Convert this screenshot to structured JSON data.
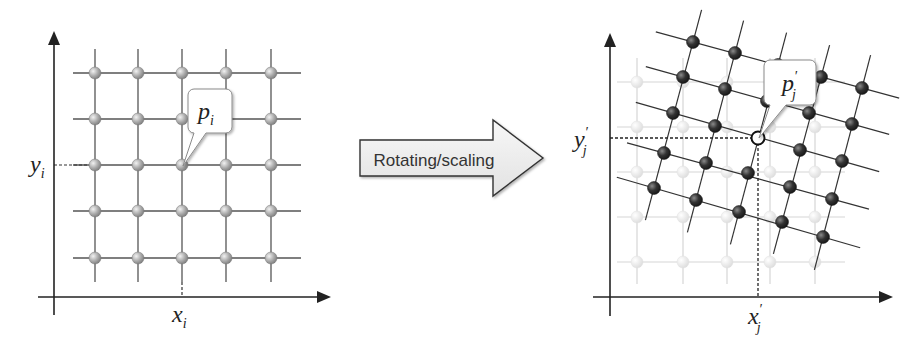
{
  "left_panel": {
    "name": "original-grid",
    "point_label": "p",
    "point_sub": "i",
    "x_label": "x",
    "x_sub": "i",
    "y_label": "y",
    "y_sub": "i",
    "grid_cols_x": [
      95,
      138,
      182,
      226,
      271
    ],
    "grid_rows_y": [
      73,
      119,
      165,
      211,
      258
    ],
    "highlight": {
      "col": 2,
      "row": 2
    }
  },
  "transform_arrow": {
    "label": "Rotating/scaling"
  },
  "right_panel": {
    "name": "transformed-grid",
    "point_label": "p",
    "point_prime": "′",
    "point_sub": "j",
    "x_label": "x",
    "x_prime": "′",
    "x_sub": "j",
    "y_label": "y",
    "y_prime": "′",
    "y_sub": "j",
    "ghost_cols_x": [
      637,
      683,
      727,
      770,
      815
    ],
    "ghost_rows_y": [
      82,
      127,
      172,
      217,
      262
    ],
    "transformed_points": [
      [
        [
          693,
          42
        ],
        [
          735,
          53
        ],
        [
          778,
          65
        ],
        [
          821,
          77
        ],
        [
          862,
          88
        ]
      ],
      [
        [
          683,
          77
        ],
        [
          725,
          89
        ],
        [
          767,
          101
        ],
        [
          809,
          113
        ],
        [
          852,
          124
        ]
      ],
      [
        [
          673,
          113
        ],
        [
          715,
          126
        ],
        [
          758,
          138
        ],
        [
          800,
          150
        ],
        [
          842,
          161
        ]
      ],
      [
        [
          664,
          153
        ],
        [
          706,
          163
        ],
        [
          748,
          173
        ],
        [
          790,
          187
        ],
        [
          832,
          199
        ]
      ],
      [
        [
          654,
          188
        ],
        [
          696,
          200
        ],
        [
          739,
          212
        ],
        [
          782,
          222
        ],
        [
          823,
          237
        ]
      ]
    ],
    "highlight": {
      "row": 2,
      "col": 2
    }
  },
  "colors": {
    "axis": "#222222",
    "grid_line": "#555555",
    "ghost_line": "#d6d6d6",
    "ghost_point": "#e4e4e4",
    "light_point": "#a9a9a9",
    "dark_point": "#2f2f2f",
    "arrow_fill": "#eeeeee",
    "arrow_stroke": "#333333"
  }
}
